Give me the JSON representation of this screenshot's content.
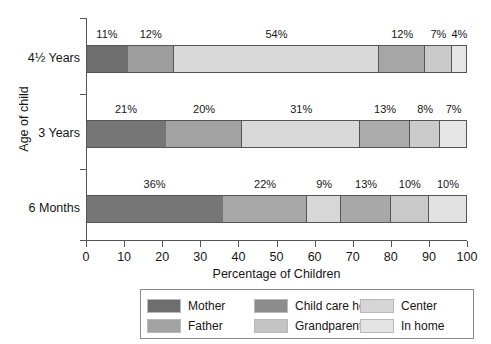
{
  "chart_data": {
    "type": "bar",
    "orientation": "horizontal",
    "stacked": true,
    "title": "",
    "xlabel": "Percentage of Children",
    "ylabel": "Age of child",
    "xlim": [
      0,
      100
    ],
    "xticks": [
      0,
      10,
      20,
      30,
      40,
      50,
      60,
      70,
      80,
      90,
      100
    ],
    "xtick_labels": [
      "0",
      "10",
      "20",
      "30",
      "40",
      "50",
      "60",
      "70",
      "80",
      "90",
      "100"
    ],
    "grid": false,
    "legend_position": "bottom",
    "categories": [
      "4½ Years",
      "3 Years",
      "6 Months"
    ],
    "series": [
      {
        "name": "Mother",
        "color": "#6e6e6e",
        "values": [
          11,
          21,
          36
        ]
      },
      {
        "name": "Father",
        "color": "#9d9d9d",
        "values": [
          12,
          20,
          22
        ]
      },
      {
        "name": "Child care home",
        "color": "#848484",
        "values": [
          54,
          31,
          9
        ]
      },
      {
        "name": "Grandparent",
        "color": "#bfbfbf",
        "values": [
          12,
          13,
          13
        ]
      },
      {
        "name": "Center",
        "color": "#d4d4d4",
        "values": [
          7,
          8,
          10
        ]
      },
      {
        "name": "In home",
        "color": "#e4e4e4",
        "values": [
          4,
          7,
          10
        ]
      }
    ],
    "bars": [
      {
        "category": "4½ Years",
        "segments": [
          {
            "series": "Mother",
            "value": 11,
            "label": "11%",
            "color": "#6e6e6e"
          },
          {
            "series": "Father",
            "value": 12,
            "label": "12%",
            "color": "#9d9d9d"
          },
          {
            "series": "Child care home",
            "value": 54,
            "label": "54%",
            "color": "#d9d9d9"
          },
          {
            "series": "Grandparent",
            "value": 12,
            "label": "12%",
            "color": "#a6a6a6"
          },
          {
            "series": "Center",
            "value": 7,
            "label": "7%",
            "color": "#c9c9c9"
          },
          {
            "series": "In home",
            "value": 4,
            "label": "4%",
            "color": "#e6e6e6"
          }
        ]
      },
      {
        "category": "3 Years",
        "segments": [
          {
            "series": "Mother",
            "value": 21,
            "label": "21%",
            "color": "#767676"
          },
          {
            "series": "Father",
            "value": 20,
            "label": "20%",
            "color": "#a3a3a3"
          },
          {
            "series": "Child care home",
            "value": 31,
            "label": "31%",
            "color": "#d9d9d9"
          },
          {
            "series": "Grandparent",
            "value": 13,
            "label": "13%",
            "color": "#ababab"
          },
          {
            "series": "Center",
            "value": 8,
            "label": "8%",
            "color": "#cbcbcb"
          },
          {
            "series": "In home",
            "value": 7,
            "label": "7%",
            "color": "#e6e6e6"
          }
        ]
      },
      {
        "category": "6 Months",
        "segments": [
          {
            "series": "Mother",
            "value": 36,
            "label": "36%",
            "color": "#767676"
          },
          {
            "series": "Father",
            "value": 22,
            "label": "22%",
            "color": "#a8a8a8"
          },
          {
            "series": "Child care home",
            "value": 9,
            "label": "9%",
            "color": "#d7d7d7"
          },
          {
            "series": "Grandparent",
            "value": 13,
            "label": "13%",
            "color": "#a8a8a8"
          },
          {
            "series": "Center",
            "value": 10,
            "label": "10%",
            "color": "#c9c9c9"
          },
          {
            "series": "In home",
            "value": 10,
            "label": "10%",
            "color": "#e2e2e2"
          }
        ]
      }
    ]
  },
  "legend": {
    "items": [
      {
        "label": "Mother",
        "color": "#6e6e6e"
      },
      {
        "label": "Father",
        "color": "#a3a3a3"
      },
      {
        "label": "Child care home",
        "color": "#8c8c8c"
      },
      {
        "label": "Grandparent",
        "color": "#c4c4c4"
      },
      {
        "label": "Center",
        "color": "#d6d6d6"
      },
      {
        "label": "In home",
        "color": "#e4e4e4"
      }
    ]
  }
}
